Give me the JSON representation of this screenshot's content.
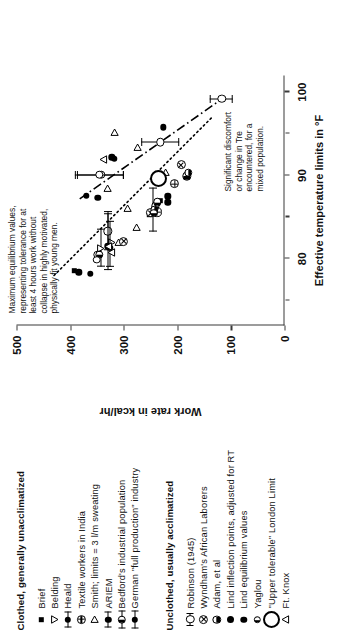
{
  "chart_data": {
    "type": "scatter",
    "title": "",
    "xlabel": "Effective temperature limits in °F",
    "ylabel": "Work rate in kcal/hr",
    "xlim": [
      72,
      102
    ],
    "ylim": [
      0,
      500
    ],
    "xticks": [
      80,
      90,
      100
    ],
    "xminorticks": [
      75,
      85,
      95
    ],
    "yticks": [
      0,
      100,
      200,
      300,
      400,
      500
    ],
    "xticklabels": [
      "80",
      "90",
      "100"
    ],
    "yticklabels": [
      "0",
      "100",
      "200",
      "300",
      "400",
      "500"
    ],
    "grid": false,
    "legend_position": "left",
    "annotations": [
      {
        "id": "note-upper",
        "text": "Maximum equilibrium values,\nrepresenting tolerance for at\nleast 4 hours work without\ncollapse in highly motivated,\nphysically fit young men."
      },
      {
        "id": "note-lower",
        "text": "Significant discomfort\nor change in Tre\nencountered, for a\nmixed population."
      }
    ],
    "trend_lines": [
      {
        "name": "upper-tolerance-line",
        "style": "dash-dot",
        "x": [
          87.2,
          99.4
        ],
        "y": [
          382,
          112
        ]
      },
      {
        "name": "lower-discomfort-line",
        "style": "dotted",
        "x": [
          78.0,
          97.0
        ],
        "y": [
          430,
          135
        ]
      }
    ],
    "series": [
      {
        "name": "Brief",
        "marker": "filled-square",
        "points": [
          {
            "x": 78.6,
            "y": 392
          },
          {
            "x": 85.3,
            "y": 251
          },
          {
            "x": 85.4,
            "y": 248
          },
          {
            "x": 87.0,
            "y": 232
          }
        ]
      },
      {
        "name": "Belding",
        "marker": "open-triangle-down",
        "points": [
          {
            "x": 81.2,
            "y": 343,
            "xerr": [
              79.0,
              83.6
            ]
          },
          {
            "x": 81.9,
            "y": 322
          }
        ]
      },
      {
        "name": "Heald",
        "marker": "open-circle-errorbar",
        "points": [
          {
            "x": 80.5,
            "y": 348
          },
          {
            "x": 83.3,
            "y": 330,
            "xerr": [
              81.0,
              85.5
            ]
          },
          {
            "x": 85.6,
            "y": 245,
            "xerr": [
              83.3,
              88.6
            ]
          },
          {
            "x": 90.1,
            "y": 342,
            "yerr": [
              300,
              388
            ]
          }
        ]
      },
      {
        "name": "Textile workers in India",
        "marker": "circle-plus",
        "points": [
          {
            "x": 85.6,
            "y": 238
          },
          {
            "x": 89.0,
            "y": 205
          }
        ]
      },
      {
        "name": "Smith; limits = 3 l/m sweating",
        "marker": "open-triangle-right",
        "points": [
          {
            "x": 82.0,
            "y": 309
          },
          {
            "x": 83.7,
            "y": 277
          },
          {
            "x": 86.0,
            "y": 292
          },
          {
            "x": 88.4,
            "y": 330
          },
          {
            "x": 90.3,
            "y": 222
          },
          {
            "x": 93.4,
            "y": 275
          },
          {
            "x": 95.2,
            "y": 318
          }
        ]
      },
      {
        "name": "ARIEM",
        "marker": "filled-circle-errorbar",
        "points": [
          {
            "x": 78.2,
            "y": 362
          },
          {
            "x": 81.3,
            "y": 326,
            "xerr": [
              79.0,
              84.6
            ]
          },
          {
            "x": 87.6,
            "y": 370
          },
          {
            "x": 92.0,
            "y": 318
          }
        ]
      },
      {
        "name": "Bedford's industrial population",
        "marker": "half-circle-left",
        "points": [
          {
            "x": 80.5,
            "y": 345
          },
          {
            "x": 86.3,
            "y": 241
          },
          {
            "x": 86.8,
            "y": 237
          },
          {
            "x": 89.9,
            "y": 182
          }
        ]
      },
      {
        "name": "German \"full production\" industry",
        "marker": "open-circle-small",
        "points": [
          {
            "x": 79.9,
            "y": 350
          },
          {
            "x": 85.6,
            "y": 243
          }
        ]
      },
      {
        "name": "Robinson (1945)",
        "marker": "circle-errorbar",
        "points": [
          {
            "x": 90.1,
            "y": 345,
            "yerr": [
              300,
              392
            ]
          },
          {
            "x": 94.0,
            "y": 232,
            "yerr": [
              196,
              268
            ]
          },
          {
            "x": 99.2,
            "y": 117,
            "yerr": [
              96,
              140
            ]
          }
        ]
      },
      {
        "name": "Wyndham's African Laborers",
        "marker": "circle-x",
        "points": [
          {
            "x": 85.5,
            "y": 250
          },
          {
            "x": 82.1,
            "y": 300
          },
          {
            "x": 91.3,
            "y": 193
          }
        ]
      },
      {
        "name": "Adam, et al",
        "marker": "half-circle-bottom",
        "points": [
          {
            "x": 85.9,
            "y": 243
          },
          {
            "x": 90.3,
            "y": 180
          }
        ]
      },
      {
        "name": "Lind inflection points, adjusted for RT",
        "marker": "filled-circle",
        "points": [
          {
            "x": 78.4,
            "y": 384
          },
          {
            "x": 87.3,
            "y": 348
          },
          {
            "x": 92.2,
            "y": 322
          },
          {
            "x": 95.8,
            "y": 226
          },
          {
            "x": 87.5,
            "y": 218
          }
        ]
      },
      {
        "name": "Lind equilibrium values",
        "marker": "filled-circle-bold",
        "points": [
          {
            "x": 81.5,
            "y": 330,
            "xerr": [
              78.6,
              85.7
            ]
          },
          {
            "x": 86.8,
            "y": 218
          }
        ]
      },
      {
        "name": "Yaglou",
        "marker": "small-open-circle",
        "points": [
          {
            "x": 85.5,
            "y": 244
          }
        ]
      },
      {
        "name": "\"Upper tolerable\" London Limit",
        "marker": "large-open-circle",
        "points": [
          {
            "x": 89.6,
            "y": 236
          }
        ]
      },
      {
        "name": "Ft. Knox",
        "marker": "open-triangle-up",
        "points": [
          {
            "x": 81.5,
            "y": 329
          },
          {
            "x": 80.8,
            "y": 323
          },
          {
            "x": 91.9,
            "y": 338
          }
        ]
      }
    ]
  },
  "legend": {
    "clothed": {
      "title": "Clothed, generally unacclimatized",
      "items": [
        {
          "label": "Brief",
          "marker": "filled-square"
        },
        {
          "label": "Belding",
          "marker": "open-triangle-down"
        },
        {
          "label": "Heald",
          "marker": "open-circle-errorbar"
        },
        {
          "label": "Textile workers in India",
          "marker": "circle-plus"
        },
        {
          "label": "Smith; limits = 3 l/m sweating",
          "marker": "open-triangle-right"
        },
        {
          "label": "ARIEM",
          "marker": "filled-circle-errorbar"
        },
        {
          "label": "Bedford's industrial population",
          "marker": "half-circle-errorbar"
        },
        {
          "label": "German \"full production\" industry",
          "marker": "open-circle-errorbar2"
        }
      ]
    },
    "unclothed": {
      "title": "Unclothed, usually acclimatized",
      "items": [
        {
          "label": "Robinson (1945)",
          "marker": "circle-errorbar"
        },
        {
          "label": "Wyndham's African Laborers",
          "marker": "circle-x"
        },
        {
          "label": "Adam, et al",
          "marker": "half-circle-bottom",
          "underline": "et al"
        },
        {
          "label": "Lind inflection points, adjusted for RT",
          "marker": "filled-circle"
        },
        {
          "label": "Lind equilibrium values",
          "marker": "filled-circle-bold"
        },
        {
          "label": "Yaglou",
          "marker": "small-open-circle"
        },
        {
          "label": "\"Upper tolerable\" London Limit",
          "marker": "large-open-circle"
        },
        {
          "label": "Ft. Knox",
          "marker": "open-triangle-up"
        }
      ]
    }
  }
}
